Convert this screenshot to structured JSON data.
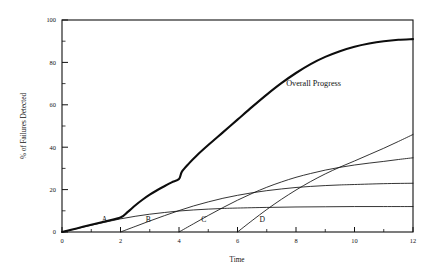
{
  "chart_data": {
    "type": "line",
    "title": "",
    "xlabel": "Time",
    "ylabel": "% of Failures Detected",
    "xlim": [
      0,
      12
    ],
    "ylim": [
      0,
      100
    ],
    "xticks": [
      0,
      2,
      4,
      6,
      8,
      10,
      12
    ],
    "yticks": [
      0,
      20,
      40,
      60,
      80,
      100
    ],
    "xtick_labels": [
      "0",
      "2",
      "4",
      "6",
      "8",
      "10",
      "12"
    ],
    "ytick_labels": [
      "0",
      "20",
      "40",
      "60",
      "80",
      "100"
    ],
    "minor_ticks": true,
    "grid": false,
    "legend": "none",
    "annotations": [
      {
        "text": "Overall Progress",
        "x": 8.6,
        "y": 69
      }
    ],
    "series": [
      {
        "name": "A",
        "label": "A",
        "label_x": 1.45,
        "label_y": 4.5,
        "style": "thin",
        "start_x": 0,
        "plateau": 12,
        "points": [
          [
            0,
            0
          ],
          [
            0.5,
            1.6
          ],
          [
            1,
            3.2
          ],
          [
            1.5,
            4.7
          ],
          [
            2,
            6.2
          ],
          [
            2.5,
            7.4
          ],
          [
            3,
            8.4
          ],
          [
            3.5,
            9.2
          ],
          [
            4,
            9.9
          ],
          [
            4.5,
            10.4
          ],
          [
            5,
            10.8
          ],
          [
            5.5,
            11.1
          ],
          [
            6,
            11.3
          ],
          [
            7,
            11.6
          ],
          [
            8,
            11.8
          ],
          [
            9,
            11.9
          ],
          [
            10,
            12.0
          ],
          [
            11,
            12.0
          ],
          [
            12,
            12.0
          ]
        ]
      },
      {
        "name": "B",
        "label": "B",
        "label_x": 2.95,
        "label_y": 4.5,
        "style": "thin",
        "start_x": 2,
        "plateau": 23,
        "points": [
          [
            2,
            0
          ],
          [
            2.5,
            2.6
          ],
          [
            3,
            5.2
          ],
          [
            3.5,
            7.7
          ],
          [
            4,
            10.1
          ],
          [
            4.5,
            12.3
          ],
          [
            5,
            14.2
          ],
          [
            5.5,
            15.9
          ],
          [
            6,
            17.3
          ],
          [
            6.5,
            18.5
          ],
          [
            7,
            19.5
          ],
          [
            7.5,
            20.3
          ],
          [
            8,
            21.0
          ],
          [
            8.5,
            21.5
          ],
          [
            9,
            21.9
          ],
          [
            9.5,
            22.2
          ],
          [
            10,
            22.4
          ],
          [
            11,
            22.8
          ],
          [
            12,
            23.0
          ]
        ]
      },
      {
        "name": "C",
        "label": "C",
        "label_x": 4.85,
        "label_y": 4.5,
        "style": "thin",
        "start_x": 4,
        "plateau": 35,
        "points": [
          [
            4,
            0
          ],
          [
            4.5,
            3.9
          ],
          [
            5,
            7.8
          ],
          [
            5.5,
            11.5
          ],
          [
            6,
            15.0
          ],
          [
            6.5,
            18.2
          ],
          [
            7,
            21.1
          ],
          [
            7.5,
            23.6
          ],
          [
            8,
            25.8
          ],
          [
            8.5,
            27.6
          ],
          [
            9,
            29.2
          ],
          [
            9.5,
            30.5
          ],
          [
            10,
            31.6
          ],
          [
            10.5,
            32.5
          ],
          [
            11,
            33.3
          ],
          [
            11.5,
            34.2
          ],
          [
            12,
            35.0
          ]
        ]
      },
      {
        "name": "D",
        "label": "D",
        "label_x": 6.85,
        "label_y": 4.5,
        "style": "thin",
        "start_x": 6,
        "plateau": 46,
        "points": [
          [
            6,
            0
          ],
          [
            6.5,
            5.4
          ],
          [
            7,
            10.6
          ],
          [
            7.5,
            15.4
          ],
          [
            8,
            19.8
          ],
          [
            8.5,
            23.8
          ],
          [
            9,
            27.4
          ],
          [
            9.5,
            30.6
          ],
          [
            10,
            33.5
          ],
          [
            10.5,
            36.5
          ],
          [
            11,
            39.5
          ],
          [
            11.5,
            42.7
          ],
          [
            12,
            46.0
          ]
        ]
      },
      {
        "name": "Overall Progress",
        "label": "Overall Progress",
        "style": "bold",
        "start_x": 0,
        "plateau": 91,
        "points": [
          [
            0,
            0
          ],
          [
            0.5,
            1.7
          ],
          [
            1,
            3.4
          ],
          [
            1.5,
            5.1
          ],
          [
            2,
            6.8
          ],
          [
            2.25,
            9.5
          ],
          [
            2.5,
            12.5
          ],
          [
            2.75,
            15.2
          ],
          [
            3,
            17.6
          ],
          [
            3.25,
            19.7
          ],
          [
            3.5,
            21.6
          ],
          [
            3.75,
            23.4
          ],
          [
            4,
            25.0
          ],
          [
            4.1,
            28.5
          ],
          [
            4.35,
            32.5
          ],
          [
            4.6,
            36.0
          ],
          [
            5,
            41.0
          ],
          [
            5.5,
            47.0
          ],
          [
            6,
            53.0
          ],
          [
            6.5,
            59.0
          ],
          [
            7,
            64.8
          ],
          [
            7.5,
            70.2
          ],
          [
            8,
            75.0
          ],
          [
            8.5,
            79.2
          ],
          [
            9,
            82.6
          ],
          [
            9.5,
            85.3
          ],
          [
            10,
            87.4
          ],
          [
            10.5,
            88.9
          ],
          [
            11,
            90.0
          ],
          [
            11.5,
            90.7
          ],
          [
            12,
            91.0
          ]
        ]
      }
    ]
  }
}
